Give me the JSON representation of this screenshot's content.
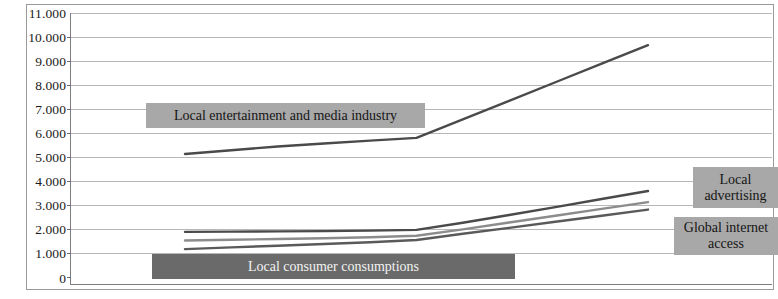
{
  "chart_data": {
    "type": "line",
    "title": "",
    "subtitle": "",
    "xlabel": "",
    "ylabel": "",
    "ylim": [
      0,
      11000
    ],
    "ytick_step": 1000,
    "grid": true,
    "legend_position": "inline-annotations",
    "y_tick_labels": [
      "11.000",
      "10.000",
      "9.000",
      "8.000",
      "7.000",
      "6.000",
      "5.000",
      "4.000",
      "3.000",
      "2.000",
      "1.000",
      "0"
    ],
    "y_tick_values": [
      11000,
      10000,
      9000,
      8000,
      7000,
      6000,
      5000,
      4000,
      3000,
      2000,
      1000,
      0
    ],
    "x": [
      0,
      1,
      2,
      3,
      4,
      5,
      6,
      7,
      8,
      9,
      10
    ],
    "series": [
      {
        "name": "Local entertainment and media industry",
        "color": "#4a4a4a",
        "values": [
          5300,
          5450,
          5600,
          5720,
          5840,
          5950,
          6700,
          7450,
          8200,
          8950,
          9700
        ]
      },
      {
        "name": "Local advertising",
        "color": "#4a4a4a",
        "values": [
          2150,
          2160,
          2170,
          2180,
          2200,
          2230,
          2520,
          2830,
          3150,
          3480,
          3800
        ]
      },
      {
        "name": "Local consumer consumptions",
        "color": "#8c8c8c",
        "values": [
          1800,
          1830,
          1860,
          1890,
          1930,
          1990,
          2250,
          2530,
          2800,
          3080,
          3350
        ]
      },
      {
        "name": "Global internet access",
        "color": "#5a5a5a",
        "values": [
          1450,
          1520,
          1590,
          1660,
          1730,
          1820,
          2070,
          2310,
          2560,
          2800,
          3050
        ]
      }
    ],
    "annotations": [
      {
        "id": "entertainment",
        "text": "Local entertainment and media industry"
      },
      {
        "id": "consumer",
        "text": "Local consumer consumptions"
      },
      {
        "id": "advertising",
        "lines": [
          "Local",
          "advertising"
        ]
      },
      {
        "id": "internet",
        "lines": [
          "Global internet",
          "access"
        ]
      }
    ]
  },
  "colors": {
    "grid": "#b7b7b7",
    "axis": "#7d7d7d",
    "frame": "#9a9a9a",
    "label_box_light": "#a8a8a8",
    "label_box_dark": "#6a6a6a",
    "label_text_dark": "#151515",
    "label_text_light": "#f2f2f2",
    "background": "#ffffff"
  }
}
